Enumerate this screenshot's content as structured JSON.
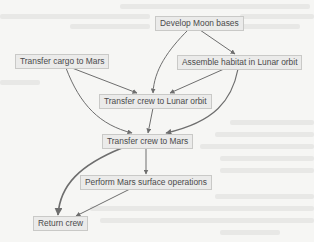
{
  "diagram": {
    "type": "flowchart",
    "colors": {
      "background": "#f6f6f4",
      "node_fill": "#ebebea",
      "node_border": "#c9c9c7",
      "text": "#4a4a4a",
      "edge": "#6e6e6e"
    },
    "nodes": [
      {
        "id": "moon_bases",
        "label": "Develop Moon bases"
      },
      {
        "id": "cargo_mars",
        "label": "Transfer cargo to Mars"
      },
      {
        "id": "habitat",
        "label": "Assemble habitat in Lunar orbit"
      },
      {
        "id": "crew_lunar",
        "label": "Transfer crew to Lunar orbit"
      },
      {
        "id": "crew_mars",
        "label": "Transfer crew to Mars"
      },
      {
        "id": "surface_ops",
        "label": "Perform Mars surface operations"
      },
      {
        "id": "return_crew",
        "label": "Return crew"
      }
    ],
    "edges": [
      {
        "from": "moon_bases",
        "to": "habitat"
      },
      {
        "from": "moon_bases",
        "to": "crew_lunar"
      },
      {
        "from": "cargo_mars",
        "to": "crew_lunar"
      },
      {
        "from": "cargo_mars",
        "to": "crew_mars"
      },
      {
        "from": "habitat",
        "to": "crew_lunar"
      },
      {
        "from": "habitat",
        "to": "crew_mars"
      },
      {
        "from": "crew_lunar",
        "to": "crew_mars"
      },
      {
        "from": "crew_mars",
        "to": "surface_ops"
      },
      {
        "from": "crew_mars",
        "to": "return_crew"
      },
      {
        "from": "surface_ops",
        "to": "return_crew"
      }
    ]
  }
}
